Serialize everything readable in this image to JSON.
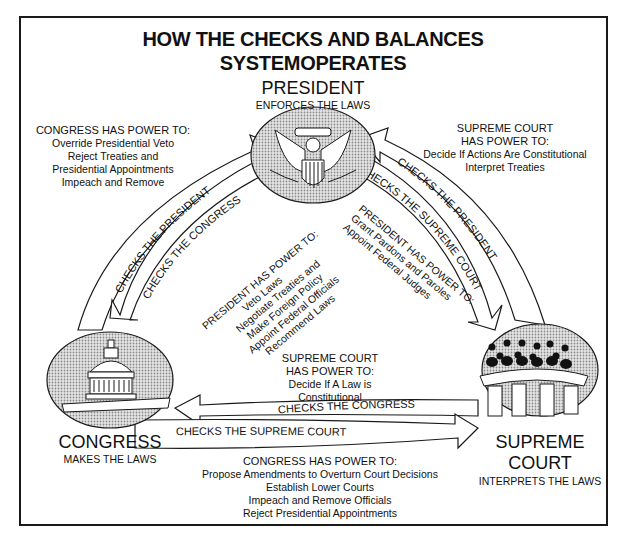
{
  "title": {
    "line1": "HOW THE CHECKS AND BALANCES",
    "line2": "SYSTEMOPERATES"
  },
  "nodes": {
    "president": {
      "name": "PRESIDENT",
      "role": "ENFORCES THE LAWS",
      "icon": "presidential-seal-eagle-icon"
    },
    "congress": {
      "name": "CONGRESS",
      "role": "MAKES THE LAWS",
      "icon": "capitol-dome-icon"
    },
    "supreme_court": {
      "name_line1": "SUPREME",
      "name_line2": "COURT",
      "role": "INTERPRETS THE LAWS",
      "icon": "justices-bench-icon"
    }
  },
  "arrows": {
    "congress_to_president": "CHECKS THE PRESIDENT",
    "president_to_congress": "CHECKS THE CONGRESS",
    "president_to_court": "CHECKS THE SUPREME COURT",
    "court_to_president": "CHECKS THE PRESIDENT",
    "court_to_congress": "CHECKS THE CONGRESS",
    "congress_to_court": "CHECKS THE SUPREME COURT"
  },
  "powers": {
    "congress_over_president": {
      "heading": "CONGRESS HAS POWER TO:",
      "items": [
        "Override Presidential Veto",
        "Reject Treaties and",
        "Presidential Appointments",
        "Impeach and Remove"
      ]
    },
    "court_over_president": {
      "heading_line1": "SUPREME COURT",
      "heading_line2": "HAS POWER TO:",
      "items": [
        "Decide If Actions Are Constitutional",
        "Interpret Treaties"
      ]
    },
    "president_over_congress": {
      "heading": "PRESIDENT HAS POWER TO:",
      "items": [
        "Veto Laws",
        "Negotiate Treaties and",
        "Make Foreign Policy",
        "Appoint Federal Officials",
        "Recommend Laws"
      ]
    },
    "president_over_court": {
      "heading": "PRESIDENT HAS POWER TO:",
      "items": [
        "Grant Pardons and Paroles",
        "Appoint Federal Judges"
      ]
    },
    "court_over_congress": {
      "heading_line1": "SUPREME COURT",
      "heading_line2": "HAS POWER TO:",
      "items": [
        "Decide If A Law is",
        "Constitutional"
      ]
    },
    "congress_over_court": {
      "heading": "CONGRESS HAS POWER TO:",
      "items": [
        "Propose Amendments to Overturn Court Decisions",
        "Establish Lower Courts",
        "Impeach and Remove Officials",
        "Reject Presidential Appointments"
      ]
    }
  },
  "colors": {
    "ink": "#111111",
    "seal_fill": "#c8c8c8",
    "background": "#ffffff"
  }
}
